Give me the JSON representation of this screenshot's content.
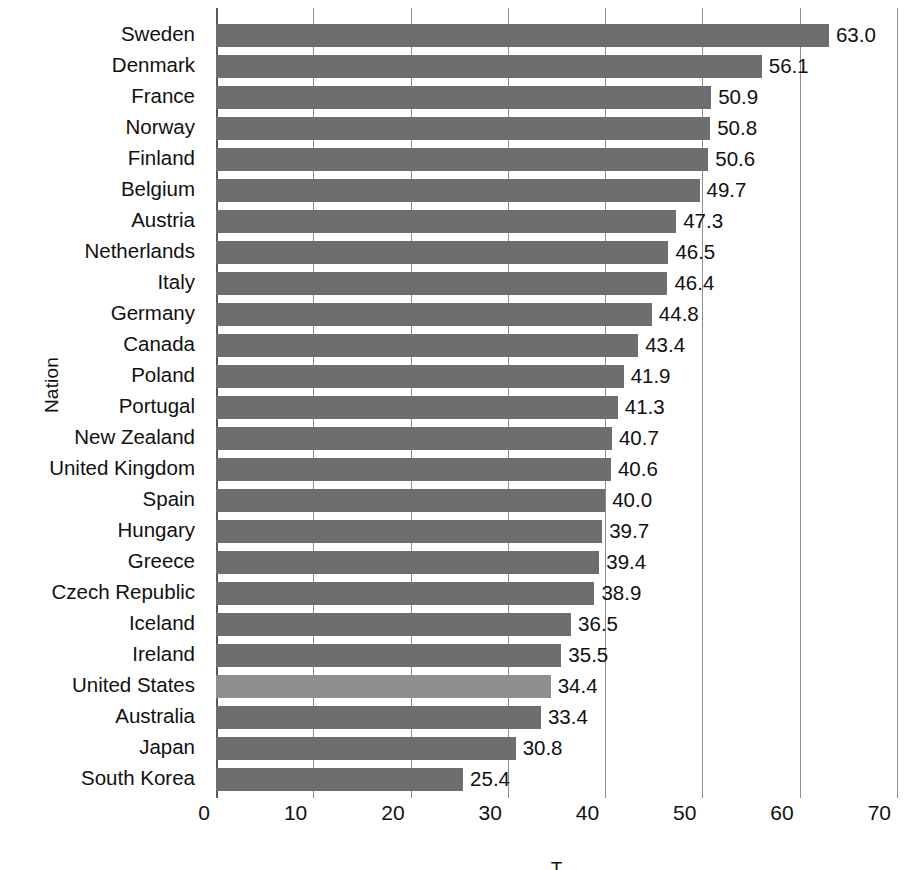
{
  "chart_data": {
    "type": "bar",
    "orientation": "horizontal",
    "title": "",
    "xlabel": "T",
    "ylabel": "Nation",
    "xlim": [
      0,
      70
    ],
    "xticks": [
      0,
      10,
      20,
      30,
      40,
      50,
      60,
      70
    ],
    "grid": true,
    "legend": "none",
    "highlight_category": "United States",
    "colors": {
      "bar": "#6e6e6e",
      "bar_highlight": "#8e8e8e",
      "gridline": "#8d8d8d",
      "axis": "#5a5a5a",
      "text": "#111111",
      "background": "#ffffff"
    },
    "categories": [
      "Sweden",
      "Denmark",
      "France",
      "Norway",
      "Finland",
      "Belgium",
      "Austria",
      "Netherlands",
      "Italy",
      "Germany",
      "Canada",
      "Poland",
      "Portugal",
      "New Zealand",
      "United Kingdom",
      "Spain",
      "Hungary",
      "Greece",
      "Czech Republic",
      "Iceland",
      "Ireland",
      "United States",
      "Australia",
      "Japan",
      "South Korea"
    ],
    "values": [
      63.0,
      56.1,
      50.9,
      50.8,
      50.6,
      49.7,
      47.3,
      46.5,
      46.4,
      44.8,
      43.4,
      41.9,
      41.3,
      40.7,
      40.6,
      40.0,
      39.7,
      39.4,
      38.9,
      36.5,
      35.5,
      34.4,
      33.4,
      30.8,
      25.4
    ],
    "value_labels": [
      "63.0",
      "56.1",
      "50.9",
      "50.8",
      "50.6",
      "49.7",
      "47.3",
      "46.5",
      "46.4",
      "44.8",
      "43.4",
      "41.9",
      "41.3",
      "40.7",
      "40.6",
      "40.0",
      "39.7",
      "39.4",
      "38.9",
      "36.5",
      "35.5",
      "34.4",
      "33.4",
      "30.8",
      "25.4"
    ],
    "xtick_labels": [
      "0",
      "10",
      "20",
      "30",
      "40",
      "50",
      "60",
      "70"
    ]
  }
}
